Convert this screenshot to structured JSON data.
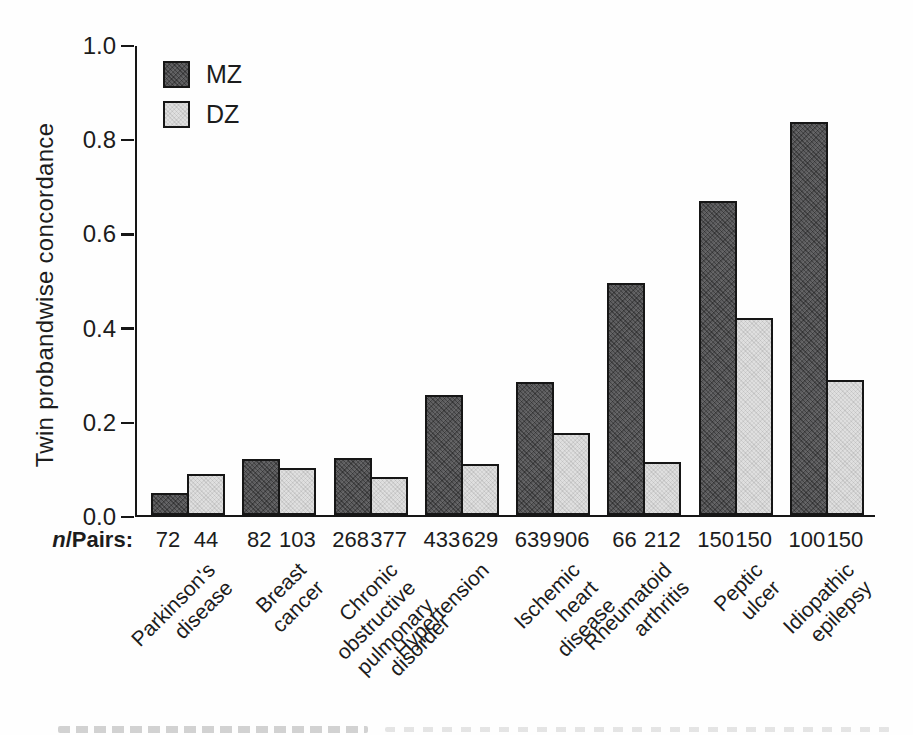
{
  "figure": {
    "n_pairs_label": {
      "italic": "n",
      "rest": "/Pairs:"
    },
    "y_axis": {
      "tick_labels": [
        "1.0",
        "0.8",
        "0.6",
        "0.4",
        "0.2",
        "0.0"
      ],
      "tick_values": [
        1.0,
        0.8,
        0.6,
        0.4,
        0.2,
        0.0
      ]
    }
  },
  "chart_data": {
    "type": "bar",
    "title": "",
    "xlabel": "",
    "ylabel": "Twin probandwise concordance",
    "ylim": [
      0,
      1.0
    ],
    "yticks": [
      0.0,
      0.2,
      0.4,
      0.6,
      0.8,
      1.0
    ],
    "grid": false,
    "legend_position": "upper-left-inside",
    "categories": [
      "Parkinson's\ndisease",
      "Breast cancer",
      "Chronic obstructive\npulmonary disorder",
      "Hypertension",
      "Ischemic heart\ndisease",
      "Rheumatoid\narthritis",
      "Peptic ulcer",
      "Idiopathic\nepilepsy"
    ],
    "series": [
      {
        "name": "MZ",
        "color": "#5d5d5f",
        "values": [
          0.048,
          0.12,
          0.122,
          0.255,
          0.284,
          0.495,
          0.67,
          0.838
        ],
        "n_pairs": [
          "72",
          "82",
          "268",
          "433",
          "639",
          "66",
          "150",
          "100"
        ]
      },
      {
        "name": "DZ",
        "color": "#dfdfdf",
        "values": [
          0.088,
          0.1,
          0.08,
          0.108,
          0.175,
          0.112,
          0.42,
          0.288
        ],
        "n_pairs": [
          "44",
          "103",
          "377",
          "629",
          "906",
          "212",
          "150",
          "150"
        ]
      }
    ]
  }
}
